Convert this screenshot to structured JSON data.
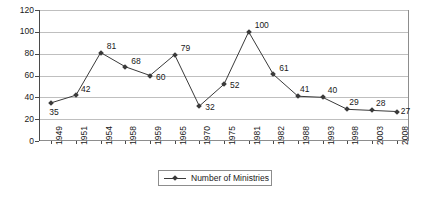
{
  "chart_data": {
    "type": "line",
    "title": "",
    "xlabel": "",
    "ylabel": "",
    "ylim": [
      0,
      120
    ],
    "ytick_step": 20,
    "grid": true,
    "legend_position": "bottom-center",
    "categories": [
      "1949",
      "1951",
      "1954",
      "1958",
      "1959",
      "1965",
      "1970",
      "1975",
      "1981",
      "1982",
      "1988",
      "1993",
      "1998",
      "2003",
      "2008"
    ],
    "series": [
      {
        "name": "Number of Ministries",
        "values": [
          35,
          42,
          81,
          68,
          60,
          79,
          32,
          52,
          100,
          61,
          41,
          40,
          29,
          28,
          27
        ],
        "marker": "diamond",
        "color": "#3a3a3a"
      }
    ],
    "ytick_labels": [
      "0",
      "20",
      "40",
      "60",
      "80",
      "100",
      "120"
    ],
    "data_labels": [
      "35",
      "42",
      "81",
      "68",
      "60",
      "79",
      "32",
      "52",
      "100",
      "61",
      "41",
      "40",
      "29",
      "28",
      "27"
    ]
  },
  "legend": {
    "entries": [
      {
        "label": "Number of Ministries"
      }
    ]
  },
  "colors": {
    "series": "#3a3a3a",
    "grid": "#bfbfbf",
    "axis": "#4a4a4a",
    "frame": "#8d8d8d",
    "background": "#ffffff",
    "text": "#1a1a1a"
  }
}
